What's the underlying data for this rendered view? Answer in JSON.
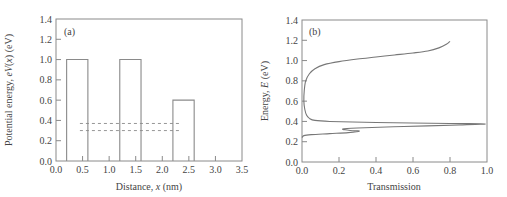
{
  "chart_data": [
    {
      "panel": "(a)",
      "type": "line",
      "title": "",
      "xlabel": "Distance, x (nm)",
      "xlabel_parts": {
        "pre": "Distance, ",
        "var": "x",
        "post": " (nm)"
      },
      "ylabel": "Potential energy, eV(x) (eV)",
      "ylabel_parts": {
        "pre": "Potential energy, ",
        "var": "eV",
        "mid": "(",
        "var2": "x",
        "post": ") (eV)"
      },
      "xlim": [
        0.0,
        3.5
      ],
      "ylim": [
        0.0,
        1.4
      ],
      "xticks": [
        "0.0",
        "0.5",
        "1.0",
        "1.5",
        "2.0",
        "2.5",
        "3.0",
        "3.5"
      ],
      "yticks": [
        "0.0",
        "0.2",
        "0.4",
        "0.6",
        "0.8",
        "1.0",
        "1.2",
        "1.4"
      ],
      "grid": false,
      "barriers": [
        {
          "x_start": 0.2,
          "x_end": 0.6,
          "height": 1.0
        },
        {
          "x_start": 1.2,
          "x_end": 1.6,
          "height": 1.0
        },
        {
          "x_start": 2.2,
          "x_end": 2.6,
          "height": 0.6
        }
      ],
      "resonance_levels": [
        {
          "energy": 0.37,
          "x_start": 0.45,
          "x_end": 2.35
        },
        {
          "energy": 0.3,
          "x_start": 0.45,
          "x_end": 2.35
        }
      ]
    },
    {
      "panel": "(b)",
      "type": "line",
      "title": "",
      "xlabel": "Transmission",
      "ylabel": "Energy, E (eV)",
      "ylabel_parts": {
        "pre": "Energy, ",
        "var": "E",
        "post": " (eV)"
      },
      "xlim": [
        0.0,
        1.0
      ],
      "ylim": [
        0.0,
        1.4
      ],
      "xticks": [
        "0.0",
        "0.2",
        "0.4",
        "0.6",
        "0.8",
        "1.0"
      ],
      "yticks": [
        "0.0",
        "0.2",
        "0.4",
        "0.6",
        "0.8",
        "1.0",
        "1.2",
        "1.4"
      ],
      "grid": false,
      "series": [
        {
          "name": "Transmission vs energy",
          "points": [
            [
              0.0,
              0.24
            ],
            [
              0.01,
              0.26
            ],
            [
              0.05,
              0.27
            ],
            [
              0.15,
              0.28
            ],
            [
              0.25,
              0.29
            ],
            [
              0.31,
              0.305
            ],
            [
              0.26,
              0.31
            ],
            [
              0.22,
              0.325
            ],
            [
              0.3,
              0.335
            ],
            [
              0.55,
              0.35
            ],
            [
              0.85,
              0.365
            ],
            [
              0.99,
              0.375
            ],
            [
              0.8,
              0.38
            ],
            [
              0.4,
              0.39
            ],
            [
              0.15,
              0.4
            ],
            [
              0.07,
              0.41
            ],
            [
              0.04,
              0.43
            ],
            [
              0.025,
              0.46
            ],
            [
              0.015,
              0.52
            ],
            [
              0.01,
              0.6
            ],
            [
              0.012,
              0.7
            ],
            [
              0.02,
              0.8
            ],
            [
              0.04,
              0.87
            ],
            [
              0.07,
              0.92
            ],
            [
              0.12,
              0.96
            ],
            [
              0.2,
              0.99
            ],
            [
              0.3,
              1.015
            ],
            [
              0.4,
              1.035
            ],
            [
              0.5,
              1.055
            ],
            [
              0.6,
              1.075
            ],
            [
              0.68,
              1.095
            ],
            [
              0.74,
              1.125
            ],
            [
              0.78,
              1.16
            ],
            [
              0.8,
              1.19
            ]
          ]
        }
      ]
    }
  ]
}
